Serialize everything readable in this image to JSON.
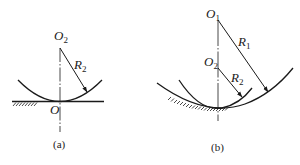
{
  "figure_a": {
    "caption": "(a)",
    "center_label": {
      "main": "O",
      "sub": "2"
    },
    "contact_label": "O",
    "radius_label": {
      "main": "R",
      "sub": "2"
    }
  },
  "figure_b": {
    "caption": "(b)",
    "center1_label": {
      "main": "O",
      "sub": "1"
    },
    "center2_label": {
      "main": "O",
      "sub": "2"
    },
    "radius1_label": {
      "main": "R",
      "sub": "1"
    },
    "radius2_label": {
      "main": "R",
      "sub": "2"
    }
  },
  "colors": {
    "ink": "#1a1a1a",
    "background": "#ffffff"
  }
}
